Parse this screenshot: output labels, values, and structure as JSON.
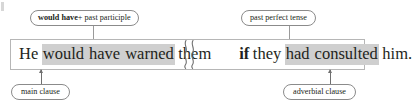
{
  "diagram": {
    "type": "grammar-sentence-annotation",
    "colors": {
      "highlight": "#cfcfcf",
      "box_border": "#b6b6b6",
      "pill_border": "#8b8b8b",
      "text": "#231f20",
      "connector": "#9a9a9a",
      "arrow": "#6f6f6f",
      "background": "#ffffff"
    }
  },
  "callouts": {
    "would_have": {
      "bold_text": "would have",
      "rest_text": " + past participle",
      "full_text": "would have + past participle"
    },
    "past_perfect": {
      "text": "past perfect tense"
    },
    "main_clause": {
      "text": "main clause"
    },
    "adverbial_clause": {
      "text": "adverbial clause"
    }
  },
  "sentence": {
    "full_text": "He would have warned them if they had consulted him.",
    "main_clause": {
      "words": [
        {
          "text": "He",
          "highlighted": false,
          "bold": false
        },
        {
          "text": "would",
          "highlighted": true,
          "bold": false
        },
        {
          "text": "have",
          "highlighted": true,
          "bold": false
        },
        {
          "text": "warned",
          "highlighted": true,
          "bold": false
        },
        {
          "text": "them",
          "highlighted": false,
          "bold": false
        }
      ]
    },
    "adverbial_clause": {
      "words": [
        {
          "text": "if",
          "highlighted": false,
          "bold": true
        },
        {
          "text": "they",
          "highlighted": false,
          "bold": false
        },
        {
          "text": "had",
          "highlighted": true,
          "bold": false
        },
        {
          "text": "consulted",
          "highlighted": true,
          "bold": false
        },
        {
          "text": "him.",
          "highlighted": false,
          "bold": false
        }
      ]
    },
    "divider": "wavy-double-line"
  }
}
